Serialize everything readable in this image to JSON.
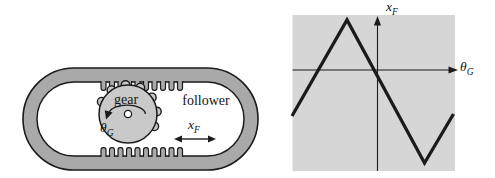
{
  "mechanism": {
    "gear_label": "gear",
    "follower_label": "follower",
    "rotation_symbol": "θ",
    "rotation_subscript": "G",
    "displacement_symbol": "x",
    "displacement_subscript": "F"
  },
  "graph": {
    "vertical_axis_symbol": "x",
    "vertical_axis_subscript": "F",
    "horizontal_axis_symbol": "θ",
    "horizontal_axis_subscript": "G"
  },
  "colors": {
    "ink": "#1b1b1b",
    "frame_gray": "#a9a9a9",
    "gear_gray": "#c9c9c9",
    "plot_gray": "#d6d6d6",
    "interior": "#ffffff"
  },
  "chart_data": {
    "type": "line",
    "title": "",
    "xlabel": "θ_G",
    "ylabel": "x_F",
    "x": [
      -85.5,
      -30.5,
      47,
      76
    ],
    "y": [
      -46,
      50,
      -93,
      -44
    ],
    "origin_px": [
      377.5,
      70
    ],
    "units": "pixel offsets from unlabeled axes (no tick marks or numeric labels shown)",
    "grid": false,
    "legend": false,
    "plot_area_bg": "#d6d6d6"
  }
}
